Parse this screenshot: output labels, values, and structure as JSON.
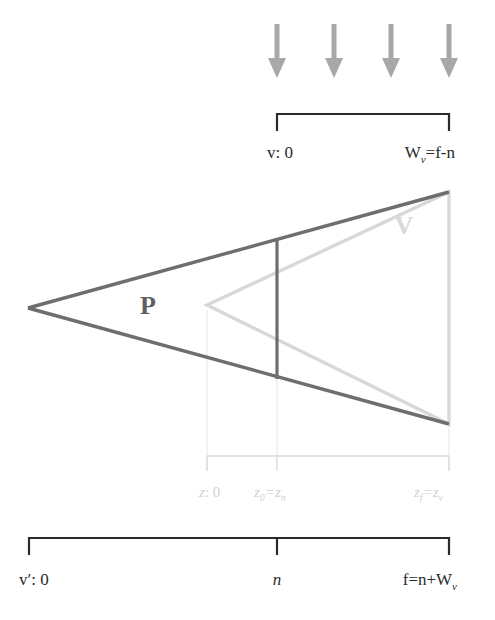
{
  "figure": {
    "colors": {
      "dark_line": "#6e6e6e",
      "light_line": "#d8d8d8",
      "arrow": "#a8a8a8",
      "bracket_black": "#2a2a2a",
      "gray_text": "#d2d2d2",
      "background": "#ffffff",
      "label_text": "#2a2a2a"
    },
    "arrows": {
      "name": "downward-arrows",
      "count": 4,
      "direction": "down",
      "x_positions": [
        277,
        334,
        391,
        449
      ],
      "y_top": 24,
      "y_bottom": 78
    },
    "top_bracket": {
      "name": "v-axis-bracket",
      "left_x": 277,
      "right_x": 449,
      "y": 114,
      "tick_height": 17,
      "labels": {
        "left": {
          "var": "v",
          "rest": ": 0"
        },
        "right": {
          "var": "W",
          "sub": "v",
          "rest": "=f-n"
        }
      }
    },
    "shapes": {
      "perspective_frustum": {
        "name": "perspective-frustum-P",
        "label": "P",
        "label_x": 148,
        "label_y": 314,
        "apex": [
          28,
          308
        ],
        "top_right": [
          449,
          192
        ],
        "bottom_right": [
          449,
          424
        ],
        "near_plane_x": 277,
        "near_plane_top_y": 239,
        "near_plane_bottom_y": 379
      },
      "orthographic_box": {
        "name": "orthographic-volume-V",
        "label": "V",
        "label_x": 404,
        "label_y": 234,
        "apex": [
          207,
          305
        ],
        "top_right": [
          449,
          192
        ],
        "bottom_right": [
          449,
          424
        ]
      }
    },
    "gray_axis": {
      "name": "z-axis-bracket",
      "left_x": 207,
      "right_x": 449,
      "mid_x": 277,
      "y": 456,
      "tick_height": 15,
      "labels": [
        {
          "var": "z",
          "rest": ": 0",
          "x": 207
        },
        {
          "var": "z",
          "sub": "0",
          "rest": "=z",
          "sub2": "n",
          "x": 277
        },
        {
          "var": "z",
          "sub": "f",
          "rest": "=z",
          "sub2": "v",
          "x": 449
        }
      ],
      "label_y": 497
    },
    "bottom_bracket": {
      "name": "vprime-axis-bracket",
      "left_x": 29,
      "right_x": 449,
      "mid_x": 277,
      "y": 538,
      "tick_height": 17,
      "labels": {
        "left": {
          "var": "v′",
          "rest": ": 0",
          "x": 29
        },
        "middle": {
          "var": "n",
          "x": 277
        },
        "right": {
          "var": "f",
          "rest": "=n+",
          "var2": "W",
          "sub2": "v",
          "x": 449
        }
      },
      "label_y": 585
    }
  }
}
